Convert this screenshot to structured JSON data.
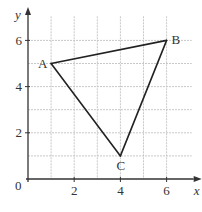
{
  "diagram": {
    "type": "coordinate-grid-triangle",
    "axes": {
      "x_label": "x",
      "y_label": "y",
      "origin_label": "0",
      "x_ticks": [
        {
          "value": 2,
          "label": "2"
        },
        {
          "value": 4,
          "label": "4"
        },
        {
          "value": 6,
          "label": "6"
        }
      ],
      "y_ticks": [
        {
          "value": 2,
          "label": "2"
        },
        {
          "value": 4,
          "label": "4"
        },
        {
          "value": 6,
          "label": "6"
        }
      ],
      "x_range": [
        0,
        7
      ],
      "y_range": [
        0,
        7
      ],
      "grid": true
    },
    "points": [
      {
        "name": "A",
        "x": 1,
        "y": 5
      },
      {
        "name": "B",
        "x": 6,
        "y": 6
      },
      {
        "name": "C",
        "x": 4,
        "y": 1
      }
    ],
    "edges": [
      [
        "A",
        "B"
      ],
      [
        "B",
        "C"
      ],
      [
        "C",
        "A"
      ]
    ],
    "colors": {
      "grid": "#c8c8c8",
      "axis": "#333333",
      "triangle": "#222222",
      "text": "#333333"
    }
  }
}
